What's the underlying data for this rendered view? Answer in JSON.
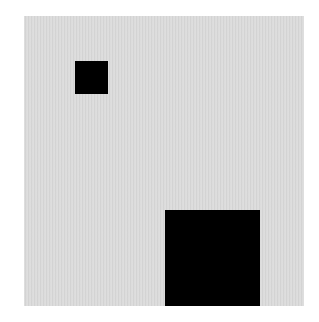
{
  "canvas": {
    "width": 319,
    "height": 322,
    "background": "#ffffff"
  },
  "panel": {
    "x": 24,
    "y": 16,
    "width": 280,
    "height": 290,
    "color": "#dadada"
  },
  "shapes": [
    {
      "name": "small-square",
      "x": 75,
      "y": 61,
      "width": 33,
      "height": 33,
      "color": "#000000"
    },
    {
      "name": "large-square",
      "x": 165,
      "y": 210,
      "width": 95,
      "height": 96,
      "color": "#000000"
    }
  ]
}
